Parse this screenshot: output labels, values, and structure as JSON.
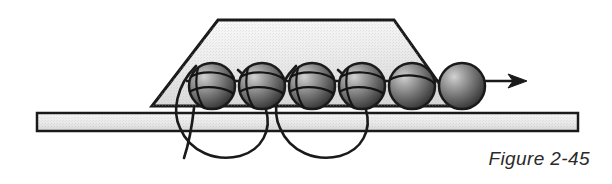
{
  "figure": {
    "caption": "Figure 2-45",
    "domain": "technical-line-diagram",
    "canvas": {
      "width": 612,
      "height": 184,
      "background": "#ffffff"
    }
  },
  "colors": {
    "background": "#ffffff",
    "outline": "#1a1a1a",
    "trapezoid_fill_light": "#f2f2f2",
    "trapezoid_fill_dark": "#d8d8d8",
    "bar_fill_light": "#f0f0f0",
    "bar_fill_dark": "#dcdcdc",
    "sphere_highlight": "#c9c9c9",
    "sphere_mid": "#6e6e6e",
    "sphere_dark": "#2b2b2b",
    "thread": "#1a1a1a"
  },
  "shapes": {
    "trapezoid": {
      "name": "presser-block",
      "points": "218,20 394,20 455,106 152,106",
      "stroke_width": 3
    },
    "bar": {
      "name": "horizontal-rail",
      "x": 37,
      "y": 113,
      "width": 541,
      "height": 18,
      "stroke_width": 2.5
    },
    "spheres": {
      "name": "bead-row",
      "radius": 23,
      "center_y": 86,
      "centers_x": [
        212,
        262,
        312,
        362,
        412,
        462
      ],
      "stroke_width": 2.5
    },
    "thread_axis": {
      "name": "thread-through-beads",
      "y": 81,
      "x_start": 186,
      "x_end": 525,
      "stroke_width": 2.5
    },
    "arrow": {
      "name": "direction-arrow",
      "tip_x": 527,
      "y": 81,
      "head_length": 17,
      "head_half_width": 7
    },
    "loops": [
      {
        "name": "thread-loop-left",
        "path": "M 196,66 C 176,86 172,112 180,128 C 190,152 216,162 240,156 C 262,150 272,130 266,110 C 262,94 250,80 238,70"
      },
      {
        "name": "thread-loop-right",
        "path": "M 296,66 C 276,86 272,112 280,128 C 290,152 316,162 340,156 C 362,150 372,130 366,110 C 362,94 350,80 338,70"
      }
    ],
    "tail": {
      "name": "thread-tail",
      "path": "M 194,110 C 192,126 189,142 185,157"
    },
    "bead_seams": {
      "name": "bead-seam-arcs",
      "stroke_width": 2.2
    }
  }
}
